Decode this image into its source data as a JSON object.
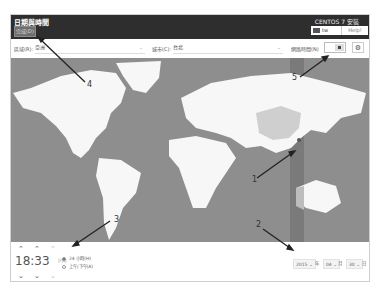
{
  "header": {
    "title": "日期與時間",
    "done_button": "完成(D)",
    "install_title": "CENTOS 7 安裝",
    "keyboard_layout": "tw",
    "help_button": "Help!"
  },
  "toolbar": {
    "region_label": "區域(R):",
    "region_value": "亞洲",
    "city_label": "城市(C):",
    "city_value": "台北",
    "network_time_label": "網路時間(N)",
    "network_time_enabled": false,
    "config_icon": "gear-icon"
  },
  "map": {
    "selected_timezone": "Asia/Taipei",
    "highlight_color": "#7a7a7a"
  },
  "time": {
    "hours": "18",
    "minutes": "33",
    "ampm": "PM",
    "format_24h_label": "24 小時(H)",
    "format_ampm_label": "上午/下午(A)",
    "format_selected": "24h"
  },
  "date": {
    "year": "2015",
    "year_unit": "年",
    "month": "04",
    "month_unit": "月",
    "day": "30",
    "day_unit": "日"
  },
  "annotations": [
    "1",
    "2",
    "3",
    "4",
    "5"
  ]
}
